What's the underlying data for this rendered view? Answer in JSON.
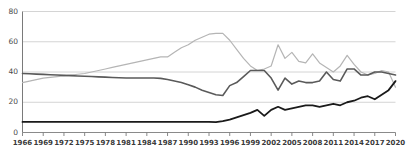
{
  "chart_data": {
    "type": "line",
    "title": "",
    "xlabel": "",
    "ylabel": "",
    "xlim": [
      1966,
      2020
    ],
    "ylim": [
      0,
      80
    ],
    "grid": true,
    "legend": "none",
    "ytick_labels": [
      "80",
      "60",
      "40",
      "20",
      "0"
    ],
    "ytick_values": [
      80,
      60,
      40,
      20,
      0
    ],
    "xtick_labels": [
      "1966",
      "1969",
      "1972",
      "1975",
      "1978",
      "1981",
      "1984",
      "1987",
      "1990",
      "1993",
      "1996",
      "1999",
      "2002",
      "2005",
      "2008",
      "2011",
      "2014",
      "2017",
      "2020"
    ],
    "xtick_values": [
      1966,
      1969,
      1972,
      1975,
      1978,
      1981,
      1984,
      1987,
      1990,
      1993,
      1996,
      1999,
      2002,
      2005,
      2008,
      2011,
      2014,
      2017,
      2020
    ],
    "x": [
      1966,
      1967,
      1968,
      1969,
      1970,
      1971,
      1972,
      1973,
      1974,
      1975,
      1976,
      1977,
      1978,
      1979,
      1980,
      1981,
      1982,
      1983,
      1984,
      1985,
      1986,
      1987,
      1988,
      1989,
      1990,
      1991,
      1992,
      1993,
      1994,
      1995,
      1996,
      1997,
      1998,
      1999,
      2000,
      2001,
      2002,
      2003,
      2004,
      2005,
      2006,
      2007,
      2008,
      2009,
      2010,
      2011,
      2012,
      2013,
      2014,
      2015,
      2016,
      2017,
      2018,
      2019,
      2020
    ],
    "series": [
      {
        "name": "series-light-gray",
        "color": "#b5b5b5",
        "width": 1.2,
        "values": [
          33,
          34,
          35,
          36,
          36.5,
          37,
          37.5,
          38,
          38.5,
          39,
          40,
          41,
          42,
          43,
          44,
          45,
          46,
          47,
          48,
          49,
          50,
          50,
          53,
          56,
          58,
          61,
          63,
          65,
          65.5,
          65.5,
          61,
          55,
          49,
          44,
          41,
          42,
          44,
          58,
          49,
          53,
          47,
          46,
          52,
          46,
          43,
          40,
          44,
          51,
          45,
          40,
          38,
          39,
          41,
          40,
          30
        ]
      },
      {
        "name": "series-dark-gray",
        "color": "#5a5a5a",
        "width": 1.6,
        "values": [
          39,
          38.8,
          38.6,
          38.4,
          38.2,
          38,
          37.8,
          37.6,
          37.4,
          37.2,
          37,
          36.8,
          36.6,
          36.4,
          36.2,
          36,
          36,
          36,
          36,
          36,
          35.8,
          35,
          34,
          33,
          31.5,
          30,
          28,
          26.5,
          25,
          24.5,
          31,
          33,
          37,
          41,
          41,
          41,
          36,
          28,
          36,
          32,
          34,
          33,
          33,
          34,
          40,
          35,
          34,
          42,
          42,
          38,
          38,
          40,
          40,
          39,
          38
        ]
      },
      {
        "name": "series-black",
        "color": "#1a1a1a",
        "width": 1.8,
        "values": [
          7,
          7,
          7,
          7,
          7,
          7,
          7,
          7,
          7,
          7,
          7,
          7,
          7,
          7,
          7,
          7,
          7,
          7,
          7,
          7,
          7,
          7,
          7,
          7,
          7,
          7,
          7,
          7,
          6.8,
          7.5,
          8.5,
          10,
          11.5,
          13,
          15,
          11,
          15,
          17,
          15,
          16,
          17,
          18,
          18,
          17,
          18,
          19,
          18,
          20,
          21,
          23,
          24,
          22,
          25,
          28,
          34
        ]
      }
    ]
  }
}
